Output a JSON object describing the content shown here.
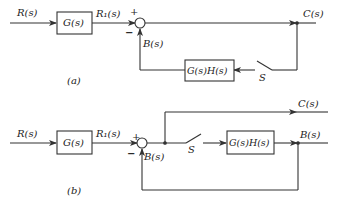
{
  "diagram_a": {
    "caption": "(a)",
    "input_label": "R(s)",
    "block_g": "G(s)",
    "r1_label": "R₁(s)",
    "plus": "+",
    "minus": "−",
    "b_label": "B(s)",
    "output_label": "C(s)",
    "block_gh": "G(s)H(s)",
    "switch_label": "S"
  },
  "diagram_b": {
    "caption": "(b)",
    "input_label": "R(s)",
    "block_g": "G(s)",
    "r1_label": "R₁(s)",
    "plus": "+",
    "minus": "−",
    "b_label_sum": "B(s)",
    "output_label": "C(s)",
    "block_gh": "G(s)H(s)",
    "switch_label": "S",
    "b_label_out": "B(s)"
  },
  "colors": {
    "line": "#333333",
    "background": "#ffffff"
  }
}
